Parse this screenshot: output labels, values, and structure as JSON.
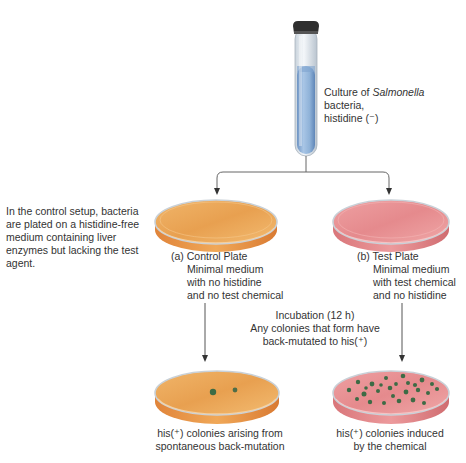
{
  "diagram": {
    "culture_label": {
      "line1_prefix": "Culture of ",
      "line1_italic": "Salmonella",
      "line1_suffix": " bacteria,",
      "line2": "histidine (⁻)"
    },
    "side_note": {
      "lines": [
        "In the control setup, bacteria",
        "are plated on a histidine-free",
        "medium containing liver",
        "enzymes but lacking the test",
        "agent."
      ]
    },
    "control_plate": {
      "title": "(a) Control Plate",
      "lines": [
        "Minimal medium",
        "with no histidine",
        "and no test chemical"
      ],
      "color": "#e89a4a"
    },
    "test_plate": {
      "title": "(b) Test Plate",
      "lines": [
        "Minimal medium",
        "with test chemical",
        "and no histidine"
      ],
      "color": "#e8898c"
    },
    "incubation": {
      "lines": [
        "Incubation (12 h)",
        "Any colonies that form have",
        "back-mutated to his(⁺)"
      ]
    },
    "control_result": {
      "lines": [
        "his(⁺) colonies arising from",
        "spontaneous back-mutation"
      ]
    },
    "test_result": {
      "lines": [
        "his(⁺) colonies induced",
        "by the chemical"
      ]
    },
    "colors": {
      "tube_liquid": "#8fb2d8",
      "colony": "#3d6b45",
      "arrow": "#555555"
    }
  }
}
